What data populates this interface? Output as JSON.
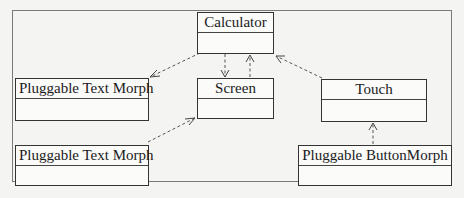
{
  "diagram": {
    "type": "uml-class-diagram",
    "classes": [
      {
        "id": "calculator",
        "name": "Calculator"
      },
      {
        "id": "pluggable-text-morph-1",
        "name": "Pluggable Text Morph"
      },
      {
        "id": "screen",
        "name": "Screen"
      },
      {
        "id": "touch",
        "name": "Touch"
      },
      {
        "id": "pluggable-text-morph-2",
        "name": "Pluggable Text Morph"
      },
      {
        "id": "pluggable-button-morph",
        "name": "Pluggable ButtonMorph"
      }
    ],
    "dependencies": [
      {
        "from": "Calculator",
        "to": "Pluggable Text Morph (top)",
        "style": "dashed",
        "arrow": "open"
      },
      {
        "from": "Calculator",
        "to": "Screen",
        "style": "dashed",
        "arrow": "open"
      },
      {
        "from": "Screen",
        "to": "Calculator",
        "style": "dashed",
        "arrow": "open"
      },
      {
        "from": "Touch",
        "to": "Calculator",
        "style": "dashed",
        "arrow": "open"
      },
      {
        "from": "Pluggable Text Morph (bottom)",
        "to": "Screen",
        "style": "dashed",
        "arrow": "open"
      },
      {
        "from": "Pluggable ButtonMorph",
        "to": "Touch",
        "style": "dashed",
        "arrow": "open"
      }
    ]
  },
  "colors": {
    "background": "#f4f4f2",
    "line": "#333333",
    "dashed_line": "#555555"
  }
}
